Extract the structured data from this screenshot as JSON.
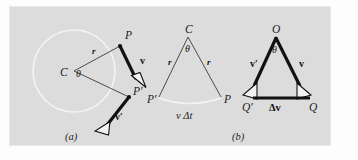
{
  "figure": {
    "caption_a": "(a)",
    "caption_b": "(b)",
    "background_color": "#dcdcdc",
    "ink_color": "#111111",
    "thin_line_color": "#3a3a3a",
    "light_curve_color": "#f4f4f4"
  },
  "panel_a": {
    "name": "circular-motion-position-diagram",
    "labels": {
      "center": "C",
      "angle": "θ",
      "radius_upper": "r",
      "point_p": "P",
      "point_p_prime": "P′",
      "velocity_v": "v",
      "velocity_v_prime": "v′"
    }
  },
  "panel_b_left": {
    "name": "radius-triangle-diagram",
    "labels": {
      "apex": "C",
      "angle": "θ",
      "radius_left": "r",
      "radius_right": "r",
      "point_p_prime": "P′",
      "point_p": "P",
      "arc_label": "v Δt"
    }
  },
  "panel_b_right": {
    "name": "velocity-triangle-diagram",
    "labels": {
      "apex": "O",
      "angle": "θ",
      "velocity_v_prime": "v′",
      "velocity_v": "v",
      "point_q_prime": "Q′",
      "point_q": "Q",
      "delta_v": "Δv"
    }
  }
}
